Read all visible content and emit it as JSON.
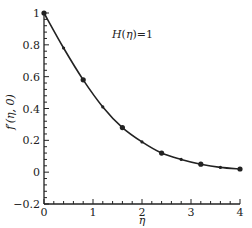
{
  "chart_data": {
    "type": "line",
    "title": "",
    "annotation": "H(η) = 1",
    "annotation_parts": {
      "func": "H",
      "arg": "η",
      "eq": " = 1"
    },
    "xlabel": "η",
    "ylabel": "f′(η, 0)",
    "xlim": [
      0,
      4
    ],
    "ylim": [
      -0.2,
      1
    ],
    "x_ticks": [
      0,
      1,
      2,
      3,
      4
    ],
    "x_tick_labels": [
      "0",
      "1",
      "2",
      "3",
      "4"
    ],
    "y_ticks": [
      -0.2,
      0,
      0.2,
      0.4,
      0.6,
      0.8,
      1
    ],
    "y_tick_labels": [
      "-0.2",
      "0",
      "0.2",
      "0.4",
      "0.6",
      "0.8",
      "1"
    ],
    "x_minor_step": 0.2,
    "y_minor_step": 0.04,
    "grid": false,
    "legend": null,
    "series": [
      {
        "name": "f'(η,0) curve",
        "style": "solid line",
        "color": "#222222",
        "x": [
          0,
          0.4,
          0.8,
          1.2,
          1.6,
          2.0,
          2.4,
          2.8,
          3.2,
          3.6,
          4.0
        ],
        "values": [
          1.0,
          0.78,
          0.58,
          0.41,
          0.28,
          0.19,
          0.12,
          0.08,
          0.05,
          0.03,
          0.02
        ]
      }
    ],
    "markers": {
      "large_filled_circles_at_x": [
        0,
        0.8,
        1.6,
        2.4,
        3.2,
        4.0
      ],
      "small_dots_at_x": [
        0.4,
        1.2,
        2.0,
        2.8,
        3.6
      ],
      "color": "#222222"
    }
  }
}
